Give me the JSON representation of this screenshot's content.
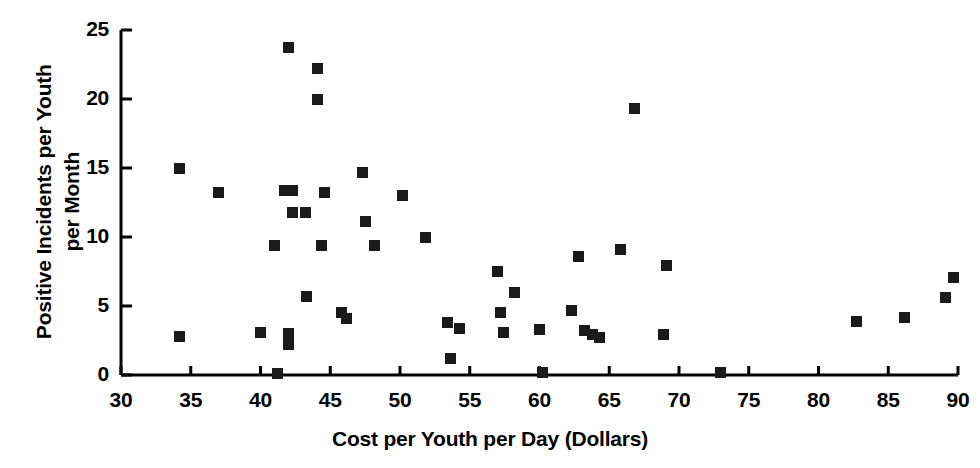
{
  "chart_data": {
    "type": "scatter",
    "title": "",
    "xlabel": "Cost per Youth per Day (Dollars)",
    "ylabel": "Positive Incidents per Youth\nper Month",
    "xlim": [
      30,
      90
    ],
    "ylim": [
      0,
      25
    ],
    "xticks": [
      30,
      35,
      40,
      45,
      50,
      55,
      60,
      65,
      70,
      75,
      80,
      85,
      90
    ],
    "yticks": [
      0,
      5,
      10,
      15,
      20,
      25
    ],
    "xtick_labels": [
      "30",
      "35",
      "40",
      "45",
      "50",
      "55",
      "60",
      "65",
      "70",
      "75",
      "80",
      "85",
      "90"
    ],
    "ytick_labels": [
      "0",
      "5",
      "10",
      "15",
      "20",
      "25"
    ],
    "grid": false,
    "legend": null,
    "marker": "filled-square",
    "marker_color": "#1a1a1a",
    "points": [
      {
        "x": 34.2,
        "y": 15.0
      },
      {
        "x": 34.2,
        "y": 2.8
      },
      {
        "x": 37.0,
        "y": 13.2
      },
      {
        "x": 40.0,
        "y": 3.1
      },
      {
        "x": 41.0,
        "y": 9.4
      },
      {
        "x": 41.2,
        "y": 0.1
      },
      {
        "x": 41.7,
        "y": 13.4
      },
      {
        "x": 42.0,
        "y": 23.7
      },
      {
        "x": 42.0,
        "y": 3.0
      },
      {
        "x": 42.0,
        "y": 2.2
      },
      {
        "x": 42.3,
        "y": 13.4
      },
      {
        "x": 42.3,
        "y": 11.8
      },
      {
        "x": 43.2,
        "y": 11.8
      },
      {
        "x": 43.3,
        "y": 5.7
      },
      {
        "x": 44.1,
        "y": 22.2
      },
      {
        "x": 44.1,
        "y": 20.0
      },
      {
        "x": 44.4,
        "y": 9.4
      },
      {
        "x": 44.6,
        "y": 13.2
      },
      {
        "x": 45.8,
        "y": 4.5
      },
      {
        "x": 46.2,
        "y": 4.1
      },
      {
        "x": 47.3,
        "y": 14.7
      },
      {
        "x": 47.5,
        "y": 11.1
      },
      {
        "x": 48.2,
        "y": 9.4
      },
      {
        "x": 50.2,
        "y": 13.0
      },
      {
        "x": 51.8,
        "y": 10.0
      },
      {
        "x": 53.4,
        "y": 3.8
      },
      {
        "x": 53.6,
        "y": 1.2
      },
      {
        "x": 54.3,
        "y": 3.4
      },
      {
        "x": 57.0,
        "y": 7.5
      },
      {
        "x": 57.2,
        "y": 4.5
      },
      {
        "x": 57.4,
        "y": 3.1
      },
      {
        "x": 58.2,
        "y": 6.0
      },
      {
        "x": 60.0,
        "y": 3.3
      },
      {
        "x": 60.2,
        "y": 0.2
      },
      {
        "x": 62.3,
        "y": 4.7
      },
      {
        "x": 62.8,
        "y": 8.6
      },
      {
        "x": 63.2,
        "y": 3.2
      },
      {
        "x": 63.8,
        "y": 2.9
      },
      {
        "x": 64.3,
        "y": 2.7
      },
      {
        "x": 65.8,
        "y": 9.1
      },
      {
        "x": 66.8,
        "y": 19.3
      },
      {
        "x": 69.1,
        "y": 7.9
      },
      {
        "x": 68.9,
        "y": 2.9
      },
      {
        "x": 73.0,
        "y": 0.2
      },
      {
        "x": 82.7,
        "y": 3.9
      },
      {
        "x": 86.2,
        "y": 4.2
      },
      {
        "x": 89.1,
        "y": 5.6
      },
      {
        "x": 89.7,
        "y": 7.1
      }
    ]
  }
}
